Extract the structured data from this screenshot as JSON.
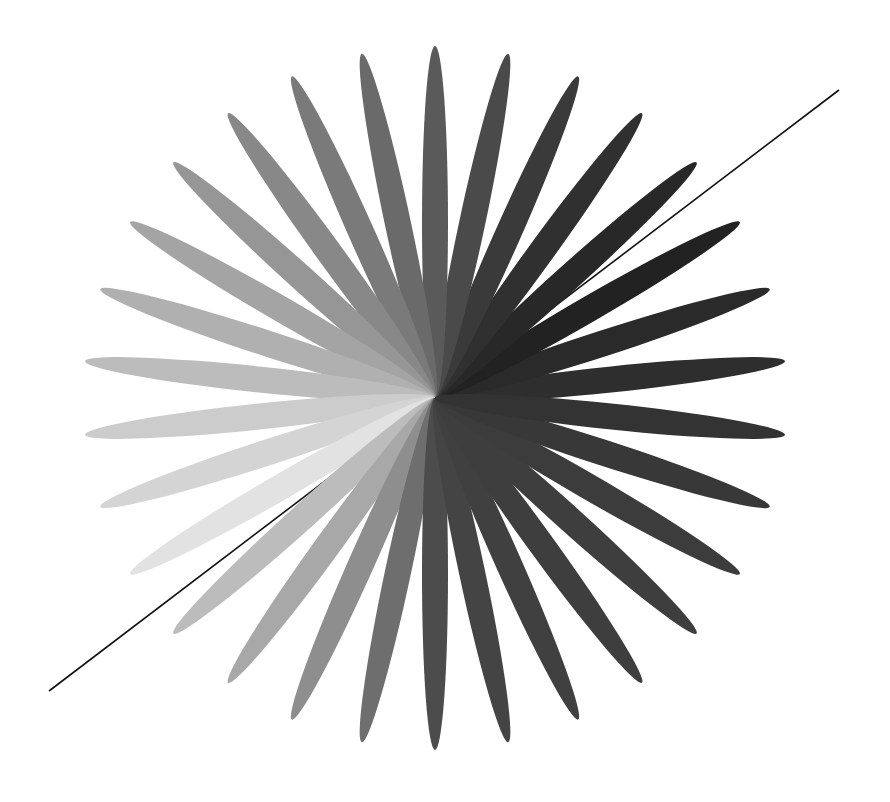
{
  "figure": {
    "width": 890,
    "height": 802,
    "background": "#ffffff",
    "center": {
      "x": 435,
      "y": 398
    },
    "petal_length": 352,
    "petal_half_width": 13,
    "petal_count": 30,
    "angle_step_deg": 12,
    "petals": [
      {
        "angle": 6,
        "color": "#2e2e2e"
      },
      {
        "angle": 18,
        "color": "#2a2a2a"
      },
      {
        "angle": 30,
        "color": "#222222"
      },
      {
        "angle": 42,
        "color": "#282828"
      },
      {
        "angle": 54,
        "color": "#303030"
      },
      {
        "angle": 66,
        "color": "#3a3a3a"
      },
      {
        "angle": 78,
        "color": "#4a4a4a"
      },
      {
        "angle": 90,
        "color": "#5a5a5a"
      },
      {
        "angle": 102,
        "color": "#6a6a6a"
      },
      {
        "angle": 114,
        "color": "#7a7a7a"
      },
      {
        "angle": 126,
        "color": "#888888"
      },
      {
        "angle": 138,
        "color": "#969696"
      },
      {
        "angle": 150,
        "color": "#a4a4a4"
      },
      {
        "angle": 162,
        "color": "#b0b0b0"
      },
      {
        "angle": 174,
        "color": "#bcbcbc"
      },
      {
        "angle": 186,
        "color": "#cccccc"
      },
      {
        "angle": 198,
        "color": "#d4d4d4"
      },
      {
        "angle": 210,
        "color": "#e2e2e2"
      },
      {
        "angle": 222,
        "color": "#bcbcbc"
      },
      {
        "angle": 234,
        "color": "#a8a8a8"
      },
      {
        "angle": 246,
        "color": "#8e8e8e"
      },
      {
        "angle": 258,
        "color": "#6e6e6e"
      },
      {
        "angle": 270,
        "color": "#4c4c4c"
      },
      {
        "angle": 282,
        "color": "#444444"
      },
      {
        "angle": 294,
        "color": "#404040"
      },
      {
        "angle": 306,
        "color": "#3e3e3e"
      },
      {
        "angle": 318,
        "color": "#3e3e3e"
      },
      {
        "angle": 330,
        "color": "#3c3c3c"
      },
      {
        "angle": 342,
        "color": "#383838"
      },
      {
        "angle": 354,
        "color": "#333333"
      }
    ],
    "line": {
      "x1": 49,
      "y1": 691,
      "x2": 839,
      "y2": 90,
      "color": "#111111",
      "width": 1.6
    }
  }
}
